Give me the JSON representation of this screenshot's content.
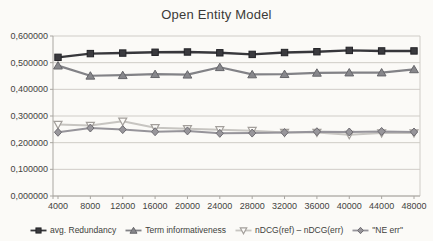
{
  "chart_data": {
    "type": "line",
    "title": "Open Entity Model",
    "xlabel": "",
    "ylabel": "",
    "categories": [
      "4000",
      "8000",
      "12000",
      "16000",
      "20000",
      "24000",
      "28000",
      "32000",
      "36000",
      "40000",
      "44000",
      "48000"
    ],
    "series": [
      {
        "name": "avg. Redundancy",
        "marker": "square",
        "values": [
          0.52,
          0.534,
          0.536,
          0.539,
          0.54,
          0.537,
          0.531,
          0.538,
          0.541,
          0.546,
          0.544,
          0.544
        ],
        "line_color": "#37373b",
        "fill_color": "#3a3a3e",
        "edge_color": "#232327",
        "line_width": 2.4
      },
      {
        "name": "Term informativeness",
        "marker": "triangle-up",
        "values": [
          0.489,
          0.451,
          0.453,
          0.457,
          0.455,
          0.483,
          0.456,
          0.457,
          0.462,
          0.463,
          0.463,
          0.475
        ],
        "line_color": "#828286",
        "fill_color": "#87878b",
        "edge_color": "#66666a",
        "line_width": 2.2
      },
      {
        "name": "nDCG(ref) – nDCG(err)",
        "marker": "triangle-down",
        "values": [
          0.268,
          0.264,
          0.28,
          0.256,
          0.252,
          0.248,
          0.245,
          0.238,
          0.238,
          0.23,
          0.236,
          0.236
        ],
        "line_color": "#c7c5c1",
        "fill_color": "#fcfbf8",
        "edge_color": "#a39f9b",
        "line_width": 2
      },
      {
        "name": "\"NE err\"",
        "marker": "diamond",
        "values": [
          0.239,
          0.255,
          0.249,
          0.241,
          0.244,
          0.235,
          0.236,
          0.238,
          0.241,
          0.24,
          0.242,
          0.24
        ],
        "line_color": "#96949a",
        "fill_color": "#98969b",
        "edge_color": "#6e6c71",
        "line_width": 2
      }
    ],
    "ylim": [
      0,
      0.6
    ],
    "ytick_step": 0.1,
    "ytick_labels": [
      "0,000000",
      "0,100000",
      "0,200000",
      "0,300000",
      "0,400000",
      "0,500000",
      "0,600000"
    ],
    "grid": true,
    "legend_position": "bottom"
  },
  "style": {
    "background": "#fbfaf7",
    "grid_color": "#cfccc7",
    "axis_color": "#a9a6a1",
    "tick_text_color": "#44433f",
    "title_color": "#3b3a38"
  }
}
